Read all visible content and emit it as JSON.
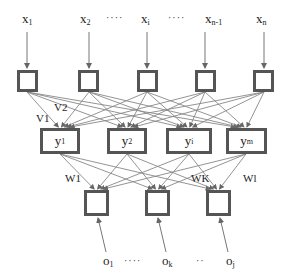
{
  "diagram": {
    "type": "neural-network",
    "inputs": [
      {
        "base": "x",
        "sub": "1"
      },
      {
        "base": "x",
        "sub": "2"
      },
      {
        "base": "x",
        "sub": "i"
      },
      {
        "base": "x",
        "sub": "n-1"
      },
      {
        "base": "x",
        "sub": "n"
      }
    ],
    "input_ellipsis": "····",
    "hidden": [
      {
        "base": "y",
        "sub": "1"
      },
      {
        "base": "y",
        "sub": "2"
      },
      {
        "base": "y",
        "sub": "i"
      },
      {
        "base": "y",
        "sub": "m"
      }
    ],
    "outputs": [
      {
        "base": "o",
        "sub": "1"
      },
      {
        "base": "o",
        "sub": "k"
      },
      {
        "base": "o",
        "sub": "j"
      }
    ],
    "output_ellipsis_1": "····",
    "output_ellipsis_2": "··",
    "weights_input_hidden": [
      {
        "base": "V",
        "sub": "1"
      },
      {
        "base": "V",
        "sub": "2"
      }
    ],
    "weights_hidden_output": [
      {
        "base": "W",
        "sub": "1"
      },
      {
        "base": "W",
        "sub": "K"
      },
      {
        "base": "W",
        "sub": "l"
      }
    ],
    "colors": {
      "node_border": "#555555",
      "edge": "#777777",
      "text": "#222222"
    }
  }
}
